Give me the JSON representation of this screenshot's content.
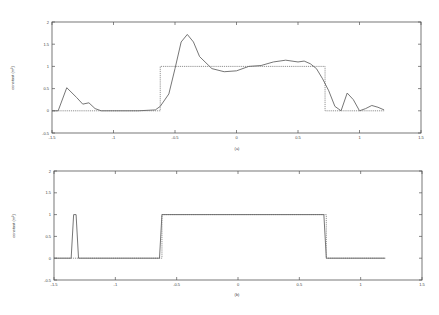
{
  "chart_data": [
    {
      "type": "line",
      "panel_label": "(a)",
      "title": "",
      "xlabel": "",
      "ylabel": "constant (m^2)",
      "xlim": [
        -1.5,
        1.5
      ],
      "ylim": [
        -0.5,
        2
      ],
      "xticks": [
        "-1.5",
        "-1",
        "-0.5",
        "0",
        "0.5",
        "1",
        "1.5"
      ],
      "yticks": [
        "-0.5",
        "0",
        "0.5",
        "1",
        "1.5",
        "2"
      ],
      "grid": false,
      "series": [
        {
          "name": "true profile",
          "style": "dotted",
          "x": [
            -1.5,
            -0.62,
            -0.62,
            0.72,
            0.72,
            1.2
          ],
          "y": [
            0,
            0,
            1,
            1,
            0,
            0
          ]
        },
        {
          "name": "reconstruction",
          "style": "solid",
          "x": [
            -1.5,
            -1.45,
            -1.38,
            -1.3,
            -1.25,
            -1.2,
            -1.15,
            -1.1,
            -0.8,
            -0.66,
            -0.62,
            -0.55,
            -0.5,
            -0.45,
            -0.4,
            -0.35,
            -0.3,
            -0.2,
            -0.1,
            0.0,
            0.1,
            0.2,
            0.3,
            0.4,
            0.5,
            0.55,
            0.6,
            0.65,
            0.7,
            0.75,
            0.8,
            0.85,
            0.9,
            0.95,
            1.0,
            1.05,
            1.1,
            1.15,
            1.2
          ],
          "y": [
            0,
            0,
            0.52,
            0.3,
            0.15,
            0.18,
            0.05,
            0,
            0,
            0.02,
            0.1,
            0.38,
            0.95,
            1.55,
            1.72,
            1.55,
            1.22,
            0.95,
            0.88,
            0.9,
            1.0,
            1.02,
            1.1,
            1.14,
            1.1,
            1.12,
            1.06,
            0.95,
            0.72,
            0.45,
            0.1,
            0.0,
            0.4,
            0.25,
            0.0,
            0.05,
            0.12,
            0.08,
            0.02
          ]
        }
      ]
    },
    {
      "type": "line",
      "panel_label": "(b)",
      "title": "",
      "xlabel": "",
      "ylabel": "constant (m^2)",
      "xlim": [
        -1.5,
        1.5
      ],
      "ylim": [
        -0.5,
        2
      ],
      "xticks": [
        "-1.5",
        "-1",
        "-0.5",
        "0",
        "0.5",
        "1",
        "1.5"
      ],
      "yticks": [
        "-0.5",
        "0",
        "0.5",
        "1",
        "1.5",
        "2"
      ],
      "grid": false,
      "series": [
        {
          "name": "true profile",
          "style": "dotted",
          "x": [
            -1.5,
            -0.62,
            -0.62,
            0.72,
            0.72,
            1.2
          ],
          "y": [
            0,
            0,
            1,
            1,
            0,
            0
          ]
        },
        {
          "name": "reconstruction",
          "style": "solid",
          "x": [
            -1.5,
            -1.36,
            -1.34,
            -1.32,
            -1.3,
            -0.64,
            -0.62,
            0.7,
            0.72,
            1.2
          ],
          "y": [
            0,
            0,
            1,
            1,
            0,
            0,
            1,
            1,
            0,
            0
          ]
        }
      ]
    }
  ],
  "panels": {
    "top": {
      "caption": "(a)",
      "ylabel": "constant (m²)"
    },
    "bottom": {
      "caption": "(b)",
      "ylabel": "constant (m²)"
    }
  }
}
